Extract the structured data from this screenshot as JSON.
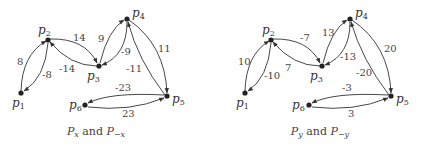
{
  "graphs": [
    {
      "caption": {
        "p1": "P",
        "s1": "x",
        "mid": " and ",
        "p2": "P",
        "s2": "−x"
      },
      "nodes": [
        "p1",
        "p2",
        "p3",
        "p4",
        "p5",
        "p6"
      ],
      "edges": [
        {
          "from": "p1",
          "to": "p2",
          "label": "8"
        },
        {
          "from": "p2",
          "to": "p1",
          "label": "-8"
        },
        {
          "from": "p2",
          "to": "p3",
          "label": "14"
        },
        {
          "from": "p3",
          "to": "p2",
          "label": "-14"
        },
        {
          "from": "p3",
          "to": "p4",
          "label": "9"
        },
        {
          "from": "p4",
          "to": "p3",
          "label": "-9"
        },
        {
          "from": "p4",
          "to": "p5",
          "label": "11"
        },
        {
          "from": "p5",
          "to": "p4",
          "label": "-11"
        },
        {
          "from": "p5",
          "to": "p6",
          "label": "-23"
        },
        {
          "from": "p6",
          "to": "p5",
          "label": "23"
        }
      ]
    },
    {
      "caption": {
        "p1": "P",
        "s1": "y",
        "mid": " and ",
        "p2": "P",
        "s2": "−y"
      },
      "nodes": [
        "p1",
        "p2",
        "p3",
        "p4",
        "p5",
        "p6"
      ],
      "edges": [
        {
          "from": "p1",
          "to": "p2",
          "label": "10"
        },
        {
          "from": "p2",
          "to": "p1",
          "label": "-10"
        },
        {
          "from": "p2",
          "to": "p3",
          "label": "-7"
        },
        {
          "from": "p3",
          "to": "p2",
          "label": "7"
        },
        {
          "from": "p3",
          "to": "p4",
          "label": "13"
        },
        {
          "from": "p4",
          "to": "p3",
          "label": "-13"
        },
        {
          "from": "p4",
          "to": "p5",
          "label": "20"
        },
        {
          "from": "p5",
          "to": "p4",
          "label": "-20"
        },
        {
          "from": "p5",
          "to": "p6",
          "label": "-3"
        },
        {
          "from": "p6",
          "to": "p5",
          "label": "3"
        }
      ]
    }
  ],
  "node_labels": {
    "p": "p",
    "n1": "1",
    "n2": "2",
    "n3": "3",
    "n4": "4",
    "n5": "5",
    "n6": "6"
  }
}
